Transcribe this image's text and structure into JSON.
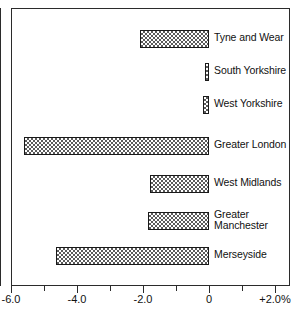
{
  "chart_data": {
    "type": "bar",
    "orientation": "horizontal",
    "title": "",
    "subtitle": "",
    "xlabel": "",
    "ylabel": "",
    "categories": [
      "Tyne and Wear",
      "South Yorkshire",
      "West Yorkshire",
      "Greater London",
      "West Midlands",
      "Greater Manchester",
      "Merseyside"
    ],
    "values": [
      -2.1,
      -0.12,
      -0.18,
      -5.6,
      -1.8,
      -1.85,
      -4.65
    ],
    "series": [
      {
        "name": "",
        "values": [
          -2.1,
          -0.12,
          -0.18,
          -5.6,
          -1.8,
          -1.85,
          -4.65
        ]
      }
    ],
    "xlim": [
      -6.0,
      2.0
    ],
    "xticks": [
      -6.0,
      -5.0,
      -4.0,
      -3.0,
      -2.0,
      -1.0,
      0,
      1.0,
      2.0
    ],
    "xtick_labels": [
      "-6.0",
      "",
      "-4.0",
      "",
      "-2.0",
      "",
      "0",
      "",
      "+2.0%"
    ],
    "major_ticks": [
      -6.0,
      -4.0,
      -2.0,
      0,
      2.0
    ],
    "grid": false,
    "legend": null,
    "legend_position": "none",
    "zero_line": 0,
    "units": "%"
  },
  "axis": {
    "labels": [
      {
        "text": "-6.0",
        "value": -6.0
      },
      {
        "text": "",
        "value": -5.0
      },
      {
        "text": "-4.0",
        "value": -4.0
      },
      {
        "text": "",
        "value": -3.0
      },
      {
        "text": "-2.0",
        "value": -2.0
      },
      {
        "text": "",
        "value": -1.0
      },
      {
        "text": "0",
        "value": 0
      },
      {
        "text": "",
        "value": 1.0
      },
      {
        "text": "+2.0%",
        "value": 2.0
      }
    ]
  },
  "bars": [
    {
      "label": "Tyne and Wear",
      "value": -2.1,
      "row": 0
    },
    {
      "label": "South Yorkshire",
      "value": -0.12,
      "row": 1
    },
    {
      "label": "West Yorkshire",
      "value": -0.18,
      "row": 2
    },
    {
      "label": "Greater London",
      "value": -5.6,
      "row": 3
    },
    {
      "label": "West Midlands",
      "value": -1.8,
      "row": 4
    },
    {
      "label": "Greater\nManchester",
      "value": -1.85,
      "row": 5
    },
    {
      "label": "Merseyside",
      "value": -4.65,
      "row": 6
    }
  ],
  "layout": {
    "plot_left_px": 11,
    "plot_top_px": 8,
    "plot_right_px": 290,
    "plot_bottom_px": 286,
    "zero_x_px": 209,
    "px_per_unit": 33.0,
    "bar_height_px": 18,
    "row_centers_px": [
      39,
      72,
      105,
      146,
      184,
      221,
      256
    ]
  },
  "colors": {
    "frame": "#2b2b2b",
    "bar_outline": "#1a1a1a",
    "bar_hatch": "#5b5b5b",
    "bar_fill": "#ffffff",
    "text": "#111111",
    "background": "#ffffff"
  }
}
